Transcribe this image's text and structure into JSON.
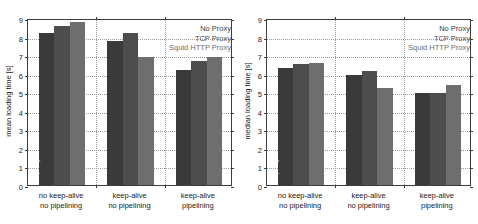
{
  "chart_data": [
    {
      "type": "bar",
      "panel": "left",
      "title": "",
      "ylabel": "mean loading time [s]",
      "xlabel": "",
      "ylim": [
        0,
        9
      ],
      "yticks": [
        0,
        1,
        2,
        3,
        4,
        5,
        6,
        7,
        8,
        9
      ],
      "grid": true,
      "legend_position": "top-right",
      "categories": [
        "no keep-alive\nno pipelining",
        "keep-alive\nno pipelining",
        "keep-alive\npipelining"
      ],
      "category_lines": [
        [
          "no keep-alive",
          "no pipelining"
        ],
        [
          "keep-alive",
          "no pipelining"
        ],
        [
          "keep-alive",
          "pipelining"
        ]
      ],
      "series": [
        {
          "name": "No Proxy",
          "bar_label": "no proxy",
          "color": "#3a3a3a",
          "values": [
            8.2,
            7.75,
            6.2
          ]
        },
        {
          "name": "TCP Proxy",
          "bar_label": "TCP proxy",
          "color": "#4d4d4d",
          "values": [
            8.55,
            8.2,
            6.7
          ]
        },
        {
          "name": "Squid HTTP Proxy",
          "bar_label": "Squid HTTP proxy",
          "color": "#6e6e6e",
          "values": [
            8.8,
            6.9,
            6.9
          ]
        }
      ]
    },
    {
      "type": "bar",
      "panel": "right",
      "title": "",
      "ylabel": "median loading time [s]",
      "xlabel": "",
      "ylim": [
        0,
        9
      ],
      "yticks": [
        0,
        1,
        2,
        3,
        4,
        5,
        6,
        7,
        8,
        9
      ],
      "grid": true,
      "legend_position": "top-right",
      "categories": [
        "no keep-alive\nno pipelining",
        "keep-alive\nno pipelining",
        "keep-alive\npipelining"
      ],
      "category_lines": [
        [
          "no keep-alive",
          "no pipelining"
        ],
        [
          "keep-alive",
          "no pipelining"
        ],
        [
          "keep-alive",
          "pipelining"
        ]
      ],
      "series": [
        {
          "name": "No Proxy",
          "bar_label": "no proxy",
          "color": "#3a3a3a",
          "values": [
            6.3,
            5.95,
            4.95
          ]
        },
        {
          "name": "TCP Proxy",
          "bar_label": "TCP proxy",
          "color": "#4d4d4d",
          "values": [
            6.5,
            6.15,
            4.95
          ]
        },
        {
          "name": "Squid HTTP Proxy",
          "bar_label": "Squid HTTP proxy",
          "color": "#6e6e6e",
          "values": [
            6.6,
            5.25,
            5.4
          ]
        }
      ]
    }
  ]
}
